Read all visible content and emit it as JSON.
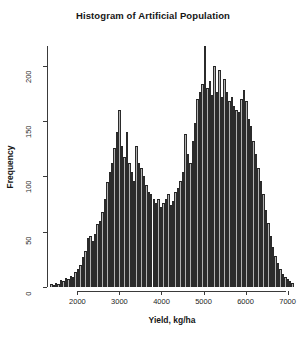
{
  "chart_data": {
    "type": "bar",
    "title": "Histogram of Artificial Population",
    "xlabel": "Yield, kg/ha",
    "ylabel": "Frequency",
    "grid": false,
    "legend": null,
    "xlim": [
      1300,
      7200
    ],
    "ylim": [
      0,
      218
    ],
    "xticks": [
      2000,
      3000,
      4000,
      5000,
      6000,
      7000
    ],
    "yticks": [
      0,
      50,
      100,
      150,
      200
    ],
    "bin_width": 58,
    "bin_starts": [
      1350,
      1408,
      1466,
      1524,
      1582,
      1640,
      1698,
      1756,
      1814,
      1872,
      1930,
      1988,
      2046,
      2104,
      2162,
      2220,
      2278,
      2336,
      2394,
      2452,
      2510,
      2568,
      2626,
      2684,
      2742,
      2800,
      2858,
      2916,
      2974,
      3032,
      3090,
      3148,
      3206,
      3264,
      3322,
      3380,
      3438,
      3496,
      3554,
      3612,
      3670,
      3728,
      3786,
      3844,
      3902,
      3960,
      4018,
      4076,
      4134,
      4192,
      4250,
      4308,
      4366,
      4424,
      4482,
      4540,
      4598,
      4656,
      4714,
      4772,
      4830,
      4888,
      4946,
      5004,
      5062,
      5120,
      5178,
      5236,
      5294,
      5352,
      5410,
      5468,
      5526,
      5584,
      5642,
      5700,
      5758,
      5816,
      5874,
      5932,
      5990,
      6048,
      6106,
      6164,
      6222,
      6280,
      6338,
      6396,
      6454,
      6512,
      6570,
      6628,
      6686,
      6744,
      6802,
      6860,
      6918,
      6976,
      7034,
      7092
    ],
    "values": [
      3,
      2,
      4,
      3,
      6,
      5,
      8,
      7,
      10,
      9,
      14,
      16,
      20,
      27,
      33,
      44,
      46,
      42,
      48,
      57,
      60,
      68,
      80,
      95,
      104,
      112,
      126,
      140,
      160,
      128,
      118,
      140,
      112,
      104,
      96,
      128,
      112,
      108,
      100,
      92,
      86,
      84,
      80,
      76,
      80,
      72,
      76,
      80,
      84,
      74,
      78,
      86,
      90,
      96,
      104,
      138,
      120,
      112,
      132,
      148,
      170,
      176,
      184,
      218,
      180,
      186,
      174,
      200,
      176,
      196,
      172,
      188,
      176,
      168,
      172,
      164,
      160,
      158,
      170,
      178,
      168,
      152,
      146,
      132,
      120,
      108,
      96,
      84,
      70,
      58,
      46,
      36,
      28,
      22,
      16,
      12,
      9,
      7,
      5,
      4
    ]
  }
}
